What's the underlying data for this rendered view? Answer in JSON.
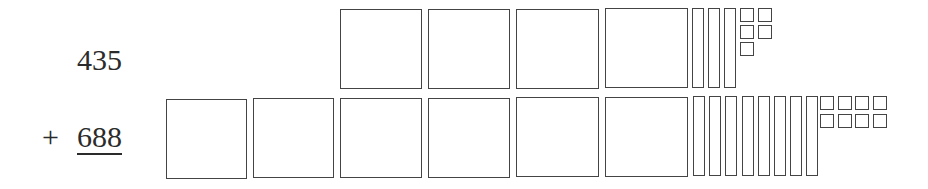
{
  "problem": {
    "top_number": "435",
    "operator": "+",
    "bottom_number": "688"
  },
  "colors": {
    "outline": "#444444",
    "background": "#ffffff",
    "text": "#2b2b2b"
  },
  "blocks": {
    "top": {
      "hundreds": 4,
      "tens": 3,
      "ones": 5
    },
    "bottom": {
      "hundreds": 6,
      "tens": 8,
      "ones": 8
    }
  }
}
